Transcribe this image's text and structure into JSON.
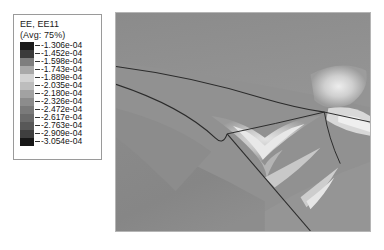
{
  "legend": {
    "title_lines": [
      "EE, EE11",
      "(Avg: 75%)"
    ],
    "variable": "EE, EE11",
    "average": "(Avg: 75%)",
    "tick_labels": [
      "-1.306e-04",
      "-1.452e-04",
      "-1.598e-04",
      "-1.743e-04",
      "-1.889e-04",
      "-2.035e-04",
      "-2.180e-04",
      "-2.326e-04",
      "-2.472e-04",
      "-2.617e-04",
      "-2.763e-04",
      "-2.909e-04",
      "-3.054e-04"
    ],
    "band_colors": [
      "#1c1c1c",
      "#3b3b3b",
      "#7e7e7e",
      "#a9a9a9",
      "#d2d2d2",
      "#bdbdbd",
      "#a2a2a2",
      "#8c8c8c",
      "#7a7a7a",
      "#6a6a6a",
      "#585858",
      "#3f3f3f",
      "#171717"
    ]
  },
  "chart_data": {
    "type": "heatmap",
    "title": "EE, EE11",
    "subtitle": "(Avg: 75%)",
    "xlabel": "",
    "ylabel": "",
    "colorbar_label": "EE, EE11",
    "colorbar_ticks": [
      -0.0001306,
      -0.0001452,
      -0.0001598,
      -0.0001743,
      -0.0001889,
      -0.0002035,
      -0.000218,
      -0.0002326,
      -0.0002472,
      -0.0002617,
      -0.0002763,
      -0.0002909,
      -0.0003054
    ],
    "value_range": [
      -0.0003054,
      -0.0001306
    ],
    "colormap": "grayscale-banded",
    "legend_position": "left",
    "grid": false,
    "field_background_value": -0.000218,
    "features": [
      {
        "name": "upper-interface-curve",
        "kind": "crack-line",
        "path": "M 0 54 Q 70 62 150 84 Q 180 93 210 100"
      },
      {
        "name": "lower-interface-curve",
        "kind": "crack-line",
        "path": "M 0 72 Q 70 92 122 130 Q 150 152 160 168"
      },
      {
        "name": "triple-junction-left",
        "kind": "junction",
        "x": 112,
        "y": 122
      },
      {
        "name": "triple-junction-right",
        "kind": "junction",
        "x": 210,
        "y": 100
      },
      {
        "name": "lower-branch-exit",
        "kind": "crack-line",
        "path": "M 112 122 Q 150 165 196 220"
      }
    ]
  }
}
